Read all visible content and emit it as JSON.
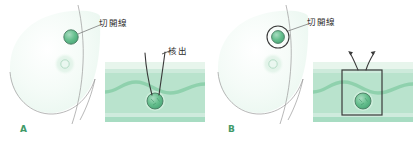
{
  "figure": {
    "background_color": "#ffffff",
    "width": 417,
    "height": 148,
    "panels": [
      {
        "letter": "A",
        "procedure_label": "核出",
        "incision_label": "切開線",
        "breast": {
          "fill_color": "#f3fbf6",
          "outline_color": "#8e8e8e",
          "areola_color": "#dff0e6",
          "nipple_color": "#cfe8da"
        },
        "tumor": {
          "fill_color": "#5cb887",
          "outline_color": "#4a7a62",
          "highlight_color": "#a8dcc0"
        },
        "cross_section": {
          "skin_color": "#e7f5ec",
          "subcutaneous_color": "#cdeadb",
          "tissue_color": "#b9e3cd",
          "fascia_color": "#8fd1ad",
          "deep_color": "#a7dcc2",
          "instrument_color": "#3a3a3a",
          "incision_marked": false
        }
      },
      {
        "letter": "B",
        "procedure_label": "",
        "incision_label": "切開線",
        "breast": {
          "fill_color": "#f3fbf6",
          "outline_color": "#8e8e8e",
          "areola_color": "#dff0e6",
          "nipple_color": "#cfe8da"
        },
        "tumor": {
          "fill_color": "#5cb887",
          "outline_color": "#4a7a62",
          "highlight_color": "#a8dcc0"
        },
        "cross_section": {
          "skin_color": "#e7f5ec",
          "subcutaneous_color": "#cdeadb",
          "tissue_color": "#b9e3cd",
          "fascia_color": "#8fd1ad",
          "deep_color": "#a7dcc2",
          "instrument_color": "#3a3a3a",
          "incision_marked": true
        }
      }
    ]
  }
}
